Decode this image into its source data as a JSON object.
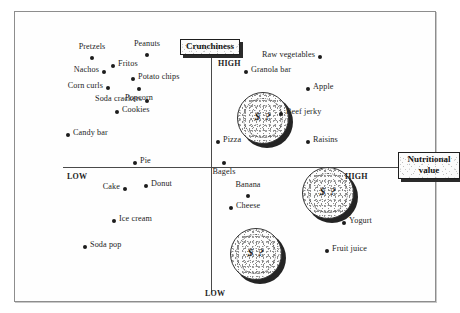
{
  "figure": {
    "kind": "perceptual-map",
    "background_color": "#ffffff",
    "frame_color": "#8d8d8d",
    "axis_color": "#4a4a4a",
    "point_color": "#1c1c1c"
  },
  "axes": {
    "vertical": {
      "title": "Crunchiness",
      "high_label": "HIGH",
      "low_label": "LOW"
    },
    "horizontal": {
      "title_line1": "Nutritional",
      "title_line2": "value",
      "low_label": "LOW",
      "high_label": "HIGH"
    }
  },
  "coins": [
    {
      "mark": "$ ?",
      "name": "price-coin-upper-right"
    },
    {
      "mark": "$ ?",
      "name": "price-coin-middle-right"
    },
    {
      "mark": "$ ?",
      "name": "price-coin-lower-center"
    }
  ],
  "chart_data": {
    "type": "scatter",
    "title": "",
    "xlabel": "Nutritional value",
    "ylabel": "Crunchiness",
    "xlim": [
      0,
      100
    ],
    "ylim": [
      0,
      100
    ],
    "grid": false,
    "legend": null,
    "annotations": [
      "Crunchiness HIGH (top)",
      "Crunchiness LOW (bottom)",
      "Nutritional value LOW (left)",
      "Nutritional value HIGH (right)"
    ],
    "quadrants": [
      "high crunchiness / low nutrition",
      "high crunchiness / high nutrition",
      "low crunchiness / low nutrition",
      "low crunchiness / high nutrition"
    ],
    "points": [
      {
        "label": "Pretzels",
        "x": 16.0,
        "y": 86.0,
        "px": 92,
        "py": 58,
        "side": "above"
      },
      {
        "label": "Peanuts",
        "x": 27.0,
        "y": 90.0,
        "px": 147,
        "py": 55,
        "side": "above"
      },
      {
        "label": "Fritos",
        "x": 22.5,
        "y": 81.0,
        "px": 113,
        "py": 66,
        "side": "right"
      },
      {
        "label": "Nachos",
        "x": 15.5,
        "y": 78.0,
        "px": 104,
        "py": 72,
        "side": "left"
      },
      {
        "label": "Potato chips",
        "x": 26.0,
        "y": 74.5,
        "px": 133,
        "py": 79,
        "side": "right"
      },
      {
        "label": "Popcorn",
        "x": 25.0,
        "y": 68.5,
        "px": 139,
        "py": 89,
        "side": "below"
      },
      {
        "label": "Corn curls",
        "x": 13.5,
        "y": 69.0,
        "px": 108,
        "py": 88,
        "side": "left"
      },
      {
        "label": "Soda crackers",
        "x": 21.5,
        "y": 62.5,
        "px": 147,
        "py": 101,
        "side": "left"
      },
      {
        "label": "Cookies",
        "x": 18.0,
        "y": 57.0,
        "px": 117,
        "py": 112,
        "side": "right"
      },
      {
        "label": "Candy bar",
        "x": 9.5,
        "y": 49.5,
        "px": 68,
        "py": 135,
        "side": "right"
      },
      {
        "label": "Raw vegetables",
        "x": 66.0,
        "y": 87.5,
        "px": 320,
        "py": 57,
        "side": "left"
      },
      {
        "label": "Granola bar",
        "x": 53.0,
        "y": 82.0,
        "px": 246,
        "py": 72,
        "side": "right"
      },
      {
        "label": "Apple",
        "x": 68.0,
        "y": 72.0,
        "px": 308,
        "py": 89,
        "side": "right"
      },
      {
        "label": "Beef jerky",
        "x": 60.0,
        "y": 63.5,
        "px": 281,
        "py": 114,
        "side": "right"
      },
      {
        "label": "Pizza",
        "x": 48.0,
        "y": 52.0,
        "px": 218,
        "py": 142,
        "side": "right"
      },
      {
        "label": "Raisins",
        "x": 67.5,
        "y": 52.0,
        "px": 308,
        "py": 142,
        "side": "right"
      },
      {
        "label": "Bagels",
        "x": 47.5,
        "y": 47.0,
        "px": 224,
        "py": 163,
        "side": "below"
      },
      {
        "label": "Pie",
        "x": 22.0,
        "y": 46.5,
        "px": 135,
        "py": 163,
        "side": "right"
      },
      {
        "label": "Donut",
        "x": 25.5,
        "y": 40.0,
        "px": 146,
        "py": 186,
        "side": "right"
      },
      {
        "label": "Cake",
        "x": 20.0,
        "y": 39.0,
        "px": 125,
        "py": 189,
        "side": "left"
      },
      {
        "label": "Banana",
        "x": 51.0,
        "y": 36.5,
        "px": 248,
        "py": 196,
        "side": "above"
      },
      {
        "label": "Cheese",
        "x": 48.5,
        "y": 32.5,
        "px": 231,
        "py": 208,
        "side": "right"
      },
      {
        "label": "Ice cream",
        "x": 18.0,
        "y": 30.0,
        "px": 114,
        "py": 221,
        "side": "right"
      },
      {
        "label": "Yogurt",
        "x": 72.0,
        "y": 28.5,
        "px": 344,
        "py": 223,
        "side": "right"
      },
      {
        "label": "Soda pop",
        "x": 12.5,
        "y": 21.0,
        "px": 85,
        "py": 247,
        "side": "right"
      },
      {
        "label": "Fruit juice",
        "x": 70.0,
        "y": 19.5,
        "px": 327,
        "py": 251,
        "side": "right"
      }
    ]
  }
}
